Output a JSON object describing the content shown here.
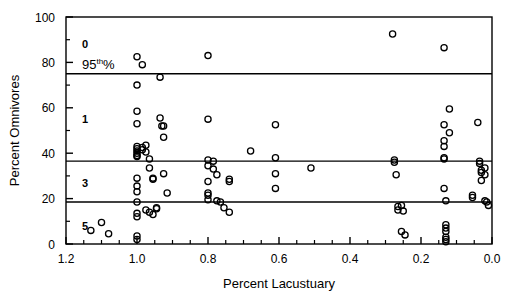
{
  "chart_data": {
    "type": "scatter",
    "title": "",
    "xlabel": "Percent Lacustuary",
    "ylabel": "Percent Omnivores",
    "xlim": [
      1.2,
      0.0
    ],
    "ylim": [
      0,
      100
    ],
    "x_reversed": true,
    "grid": false,
    "legend": null,
    "xticks": [
      1.2,
      1.0,
      0.8,
      0.6,
      0.4,
      0.2,
      0.0
    ],
    "xtick_labels": [
      "1.2",
      "1.0",
      "0.8",
      "0.6",
      "0.4",
      "0.2",
      "0.0"
    ],
    "x_minor_ticks": [
      1.15,
      1.1,
      1.05,
      0.95,
      0.9,
      0.85,
      0.75,
      0.7,
      0.65,
      0.55,
      0.5,
      0.45,
      0.35,
      0.3,
      0.25,
      0.15,
      0.1,
      0.05
    ],
    "yticks": [
      0,
      20,
      40,
      60,
      80,
      100
    ],
    "ytick_labels": [
      "0",
      "20",
      "40",
      "60",
      "80",
      "100"
    ],
    "y_minor_ticks": [
      10,
      30,
      50,
      70,
      90
    ],
    "marker": "open-circle",
    "marker_size": 4,
    "series": [
      {
        "name": "sites",
        "points": [
          [
            1.1,
            9.5
          ],
          [
            1.13,
            6.0
          ],
          [
            1.08,
            4.5
          ],
          [
            1.0,
            82.5
          ],
          [
            1.0,
            70.0
          ],
          [
            1.0,
            58.5
          ],
          [
            1.0,
            53.0
          ],
          [
            1.0,
            43.0
          ],
          [
            1.0,
            42.0
          ],
          [
            1.0,
            41.0
          ],
          [
            1.0,
            40.0
          ],
          [
            1.0,
            39.0
          ],
          [
            1.0,
            38.5
          ],
          [
            1.0,
            29.0
          ],
          [
            1.0,
            25.5
          ],
          [
            1.0,
            23.0
          ],
          [
            1.0,
            18.5
          ],
          [
            1.0,
            13.5
          ],
          [
            1.0,
            12.0
          ],
          [
            1.0,
            3.5
          ],
          [
            1.0,
            2.0
          ],
          [
            0.985,
            79.0
          ],
          [
            0.985,
            42.5
          ],
          [
            0.985,
            41.5
          ],
          [
            0.975,
            43.5
          ],
          [
            0.975,
            40.5
          ],
          [
            0.975,
            15.0
          ],
          [
            0.965,
            37.5
          ],
          [
            0.965,
            33.5
          ],
          [
            0.965,
            14.0
          ],
          [
            0.955,
            29.0
          ],
          [
            0.955,
            28.5
          ],
          [
            0.955,
            13.0
          ],
          [
            0.945,
            16.0
          ],
          [
            0.945,
            15.5
          ],
          [
            0.935,
            73.5
          ],
          [
            0.935,
            55.5
          ],
          [
            0.925,
            52.0
          ],
          [
            0.925,
            47.0
          ],
          [
            0.925,
            31.0
          ],
          [
            0.915,
            22.5
          ],
          [
            0.93,
            52.0
          ],
          [
            0.8,
            83.0
          ],
          [
            0.8,
            55.0
          ],
          [
            0.8,
            37.0
          ],
          [
            0.8,
            34.5
          ],
          [
            0.8,
            27.5
          ],
          [
            0.8,
            22.5
          ],
          [
            0.8,
            21.5
          ],
          [
            0.8,
            19.5
          ],
          [
            0.785,
            36.5
          ],
          [
            0.785,
            33.0
          ],
          [
            0.775,
            30.5
          ],
          [
            0.775,
            19.0
          ],
          [
            0.765,
            18.5
          ],
          [
            0.755,
            16.0
          ],
          [
            0.74,
            28.5
          ],
          [
            0.74,
            27.5
          ],
          [
            0.74,
            14.0
          ],
          [
            0.68,
            41.0
          ],
          [
            0.61,
            52.5
          ],
          [
            0.61,
            38.0
          ],
          [
            0.61,
            31.0
          ],
          [
            0.61,
            24.5
          ],
          [
            0.51,
            33.5
          ],
          [
            0.28,
            92.5
          ],
          [
            0.275,
            37.0
          ],
          [
            0.275,
            36.0
          ],
          [
            0.27,
            30.5
          ],
          [
            0.265,
            16.5
          ],
          [
            0.265,
            15.0
          ],
          [
            0.255,
            17.0
          ],
          [
            0.25,
            14.5
          ],
          [
            0.245,
            4.0
          ],
          [
            0.255,
            5.5
          ],
          [
            0.135,
            86.5
          ],
          [
            0.135,
            52.5
          ],
          [
            0.135,
            45.5
          ],
          [
            0.135,
            43.0
          ],
          [
            0.135,
            38.0
          ],
          [
            0.135,
            37.5
          ],
          [
            0.135,
            24.5
          ],
          [
            0.13,
            19.0
          ],
          [
            0.13,
            8.5
          ],
          [
            0.13,
            7.0
          ],
          [
            0.13,
            5.5
          ],
          [
            0.13,
            3.0
          ],
          [
            0.13,
            2.0
          ],
          [
            0.13,
            1.0
          ],
          [
            0.12,
            59.5
          ],
          [
            0.12,
            49.0
          ],
          [
            0.04,
            53.5
          ],
          [
            0.035,
            36.5
          ],
          [
            0.035,
            35.5
          ],
          [
            0.03,
            32.5
          ],
          [
            0.03,
            31.5
          ],
          [
            0.03,
            28.0
          ],
          [
            0.02,
            33.5
          ],
          [
            0.02,
            30.5
          ],
          [
            0.02,
            19.0
          ],
          [
            0.015,
            18.5
          ],
          [
            0.01,
            17.0
          ],
          [
            0.055,
            20.5
          ],
          [
            0.055,
            21.5
          ]
        ]
      }
    ],
    "reference_lines": [
      {
        "label": "95th%",
        "y": 75.0,
        "style": "solid"
      },
      {
        "y": 36.5,
        "style": "solid"
      },
      {
        "y": 18.5,
        "style": "solid"
      }
    ],
    "band_labels": [
      {
        "text": "0",
        "x": 1.155,
        "y": 88.0
      },
      {
        "text": "1",
        "x": 1.155,
        "y": 55.0
      },
      {
        "text": "3",
        "x": 1.155,
        "y": 27.0
      },
      {
        "text": "5",
        "x": 1.155,
        "y": 8.0
      }
    ],
    "percentile_annotation": {
      "prefix": "95",
      "sup": "th",
      "suffix": "%"
    }
  }
}
